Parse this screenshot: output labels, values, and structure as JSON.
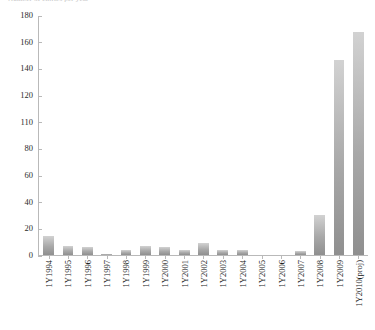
{
  "chart_data": {
    "type": "bar",
    "title": "Number of entries per year",
    "xlabel": "",
    "ylabel": "",
    "categories": [
      "1Y1994",
      "1Y1995",
      "1Y1996",
      "1Y1997",
      "1Y1998",
      "1Y1999",
      "1Y2000",
      "1Y2001",
      "1Y2002",
      "1Y2003",
      "1Y2004",
      "1Y2005",
      "1Y2006",
      "1Y2007",
      "1Y2008",
      "1Y2009",
      "1Y2010(proj)"
    ],
    "values": [
      14,
      7,
      6,
      0.5,
      4,
      7,
      6,
      4,
      9,
      4,
      4,
      0,
      0,
      3,
      30,
      147,
      168
    ],
    "ytick_labels": [
      "0",
      "20",
      "40",
      "60",
      "80",
      "110",
      "120",
      "140",
      "160",
      "180"
    ],
    "ytick_values": [
      0,
      20,
      40,
      60,
      80,
      100,
      120,
      140,
      160,
      180
    ],
    "ylim": [
      0,
      180
    ],
    "grid": false,
    "legend": "none",
    "bar_color": "#a8a8a8",
    "axis_color": "#b9b9b9"
  }
}
